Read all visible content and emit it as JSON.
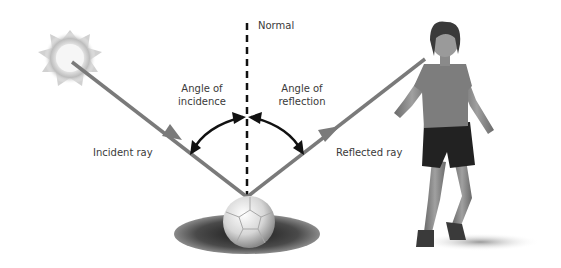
{
  "labels": {
    "normal": "Normal",
    "angle_incidence_line1": "Angle of",
    "angle_incidence_line2": "incidence",
    "angle_reflection_line1": "Angle of",
    "angle_reflection_line2": "reflection",
    "incident_ray": "Incident ray",
    "reflected_ray": "Reflected ray"
  },
  "colors": {
    "ray": "#7a7a7a",
    "normal_line": "#111111",
    "angle_arc": "#111111",
    "label_text": "#3a3a3a"
  },
  "elements": {
    "light_source": "sun-glow",
    "reflector": "soccer-ball-on-grass",
    "observer": "person-standing"
  }
}
